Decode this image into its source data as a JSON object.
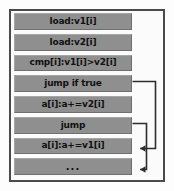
{
  "diagram": {
    "border_color": "#4a4a4a",
    "bar_color": "#8f8f8f",
    "text_color": "#111111",
    "background_color": "#fdfdfd",
    "instructions": [
      {
        "index": 0,
        "label": "load:v1[i]"
      },
      {
        "index": 1,
        "label": "load:v2[i]"
      },
      {
        "index": 2,
        "label": "cmp[i]:v1[i]>v2[i]"
      },
      {
        "index": 3,
        "label": "jump if true"
      },
      {
        "index": 4,
        "label": "a[i]:a+=v2[i]"
      },
      {
        "index": 5,
        "label": "jump"
      },
      {
        "index": 6,
        "label": "a[i]:a+=v1[i]"
      },
      {
        "index": 7,
        "label": "..."
      }
    ],
    "jumps": [
      {
        "name": "jump-if-true-arrow",
        "from": "jump if true",
        "to": "a[i]:a+=v1[i]"
      },
      {
        "name": "jump-arrow",
        "from": "jump",
        "to": "..."
      }
    ]
  }
}
